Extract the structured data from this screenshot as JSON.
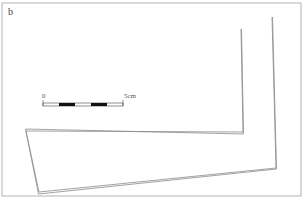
{
  "figure": {
    "panel_label": "b",
    "scale_bar": {
      "start_label": "0",
      "end_label": "5cm",
      "segments": 5
    },
    "colors": {
      "line": "#8a8a8a",
      "frame": "#9a9a9a",
      "scale_black": "#111111"
    }
  }
}
